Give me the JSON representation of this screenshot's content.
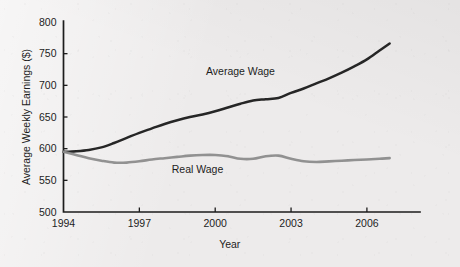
{
  "chart_data": {
    "type": "line",
    "title": "",
    "xlabel": "Year",
    "ylabel": "Average Weekly Earnings ($)",
    "xlim": [
      1994,
      11994
    ],
    "ylim": [
      500,
      800
    ],
    "xticks": [
      1994,
      1997,
      2000,
      2003,
      2006
    ],
    "xticklabels": [
      "1994",
      "1997",
      "2000",
      "2003",
      "2006"
    ],
    "yticks": [
      500,
      550,
      600,
      650,
      700,
      750,
      800
    ],
    "yticklabels": [
      "500",
      "550",
      "600",
      "650",
      "700",
      "750",
      "800"
    ],
    "grid": false,
    "legend_position": "inline-annotations",
    "x": [
      1994,
      1994.5,
      1995,
      1995.5,
      1996,
      1996.5,
      1997,
      1997.5,
      1998,
      1998.5,
      1999,
      1999.5,
      2000,
      2000.5,
      2001,
      2001.5,
      2002,
      2002.5,
      2003,
      2003.5,
      2004,
      2004.5,
      2005,
      2005.5,
      2006,
      2006.5,
      2006.9
    ],
    "series": [
      {
        "name": "Average Wage",
        "color": "#262626",
        "values": [
          595,
          596,
          598,
          602,
          609,
          617,
          625,
          632,
          639,
          645,
          650,
          654,
          659,
          665,
          671,
          676,
          678,
          680,
          688,
          695,
          703,
          711,
          720,
          730,
          741,
          755,
          766
        ]
      },
      {
        "name": "Real Wage",
        "color": "#8c8c8c",
        "values": [
          595,
          590,
          585,
          581,
          578,
          578,
          580,
          583,
          585,
          587,
          589,
          590,
          590,
          588,
          584,
          584,
          588,
          589,
          584,
          580,
          579,
          580,
          581,
          582,
          583,
          584,
          585
        ]
      }
    ],
    "annotations": [
      {
        "text": "Average Wage",
        "x": 2001.0,
        "y": 717
      },
      {
        "text": "Real Wage",
        "x": 1999.3,
        "y": 561
      }
    ]
  },
  "figure": {
    "background_color": "#edebeb",
    "axis_color": "#1c1c1c"
  }
}
